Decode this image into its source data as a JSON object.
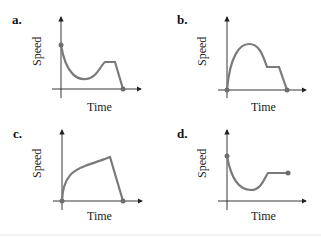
{
  "figure": {
    "panels": [
      {
        "label": "a.",
        "y_axis": "Speed",
        "x_axis": "Time",
        "description": "Starts high, decreases to a minimum, rises, levels off (constant), then drops linearly to zero"
      },
      {
        "label": "b.",
        "y_axis": "Speed",
        "x_axis": "Time",
        "description": "Starts at zero, rises to a maximum, decreases to a plateau (constant), then drops linearly to zero"
      },
      {
        "label": "c.",
        "y_axis": "Speed",
        "x_axis": "Time",
        "description": "Starts at zero, increases concavely to a peak, then drops linearly to zero"
      },
      {
        "label": "d.",
        "y_axis": "Speed",
        "x_axis": "Time",
        "description": "Starts high, decreases to a minimum, rises, then levels off at a constant speed"
      }
    ]
  },
  "colors": {
    "curve": "#7a7a7a",
    "axis": "#222222",
    "point": "#6e6e6e"
  }
}
